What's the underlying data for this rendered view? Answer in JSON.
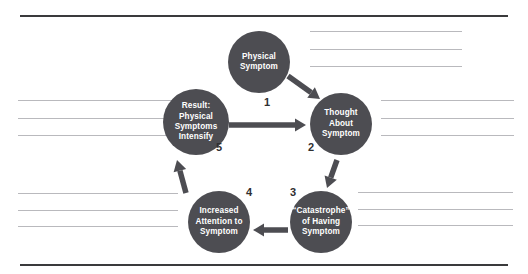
{
  "page": {
    "background_color": "#ffffff",
    "rule_color": "#3a3a3c",
    "text_line_color": "#b9b9bd"
  },
  "diagram": {
    "type": "cycle-diagram",
    "node_color": "#4d4d52",
    "node_text_color": "#ffffff",
    "number_color": "#2f2f31",
    "arrow_color": "#4d4d52",
    "nodes": [
      {
        "id": "physical-symptom",
        "number": "1",
        "label": "Physical\nSymptom",
        "cx": 259,
        "cy": 62,
        "r": 31
      },
      {
        "id": "thought-about-symptom",
        "number": "2",
        "label": "Thought\nAbout\nSymptom",
        "cx": 341,
        "cy": 124,
        "r": 31
      },
      {
        "id": "catastrophe-of-having-symptom",
        "number": "3",
        "label": "“Catastrophe”\nof Having\nSymptom",
        "cx": 321,
        "cy": 222,
        "r": 31
      },
      {
        "id": "increased-attention-to-symptom",
        "number": "4",
        "label": "Increased\nAttention to\nSymptom",
        "cx": 219,
        "cy": 222,
        "r": 31
      },
      {
        "id": "result-physical-symptoms-intensify",
        "number": "5",
        "label": "Result:\nPhysical\nSymptoms\nIntensify",
        "cx": 196,
        "cy": 122,
        "r": 33
      }
    ],
    "number_positions": [
      {
        "for": "1",
        "x": 264,
        "y": 97
      },
      {
        "for": "2",
        "x": 308,
        "y": 142
      },
      {
        "for": "3",
        "x": 290,
        "y": 187
      },
      {
        "for": "4",
        "x": 246,
        "y": 187
      },
      {
        "for": "5",
        "x": 216,
        "y": 142
      }
    ],
    "arrows": [
      {
        "id": "arrow-1-to-2",
        "from": "1",
        "to": "2",
        "x1": 288,
        "y1": 76,
        "x2": 320,
        "y2": 99
      },
      {
        "id": "arrow-5-to-2",
        "from": "5",
        "to": "2",
        "x1": 229,
        "y1": 125,
        "x2": 306,
        "y2": 125
      },
      {
        "id": "arrow-2-to-3",
        "from": "2",
        "to": "3",
        "x1": 337,
        "y1": 160,
        "x2": 327,
        "y2": 188
      },
      {
        "id": "arrow-3-to-4",
        "from": "3",
        "to": "4",
        "x1": 288,
        "y1": 230,
        "x2": 253,
        "y2": 230
      },
      {
        "id": "arrow-4-to-5",
        "from": "4",
        "to": "5",
        "x1": 186,
        "y1": 193,
        "x2": 177,
        "y2": 160
      }
    ]
  },
  "page_rules": [
    {
      "id": "top-rule",
      "x": 20,
      "y": 15,
      "width": 488
    },
    {
      "id": "bottom-rule",
      "x": 20,
      "y": 264,
      "width": 488
    }
  ],
  "text_lines": [
    {
      "id": "right-col-line-1",
      "x": 310,
      "y": 31,
      "width": 152
    },
    {
      "id": "right-col-line-2",
      "x": 310,
      "y": 49,
      "width": 152
    },
    {
      "id": "right-col-line-3",
      "x": 310,
      "y": 66,
      "width": 152
    },
    {
      "id": "left-mid-line-1",
      "x": 18,
      "y": 100,
      "width": 161
    },
    {
      "id": "left-mid-line-2",
      "x": 18,
      "y": 118,
      "width": 161
    },
    {
      "id": "left-mid-line-3",
      "x": 18,
      "y": 135,
      "width": 161
    },
    {
      "id": "right-mid-line-1",
      "x": 381,
      "y": 100,
      "width": 133
    },
    {
      "id": "right-mid-line-2",
      "x": 381,
      "y": 118,
      "width": 133
    },
    {
      "id": "right-mid-line-3",
      "x": 381,
      "y": 135,
      "width": 133
    },
    {
      "id": "left-bottom-line-1",
      "x": 18,
      "y": 193,
      "width": 160
    },
    {
      "id": "left-bottom-line-2",
      "x": 18,
      "y": 210,
      "width": 160
    },
    {
      "id": "left-bottom-line-3",
      "x": 18,
      "y": 226,
      "width": 160
    },
    {
      "id": "right-bottom-line-1",
      "x": 358,
      "y": 192,
      "width": 155
    },
    {
      "id": "right-bottom-line-2",
      "x": 358,
      "y": 209,
      "width": 155
    },
    {
      "id": "right-bottom-line-3",
      "x": 358,
      "y": 225,
      "width": 155
    }
  ]
}
